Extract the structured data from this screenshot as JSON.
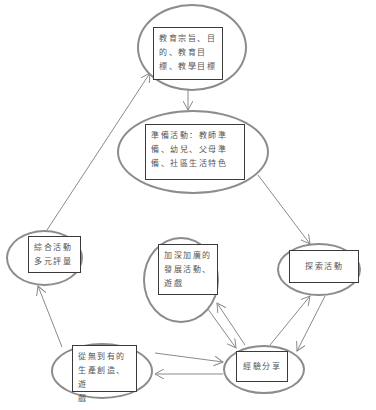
{
  "diagram": {
    "type": "cycle-flow",
    "colors": {
      "ellipse_stroke": "#8c8c8c",
      "box_stroke": "#3a3a3a",
      "text": "#555555",
      "edge": "#8a8a8a"
    },
    "nodes": [
      {
        "id": "goals",
        "lines": [
          "教育宗旨、目",
          "的、教育目",
          "標、教學目標"
        ]
      },
      {
        "id": "preparation",
        "lines": [
          "準備活動：教師準",
          "備、幼兒、父母準",
          "備、社區生活特色"
        ]
      },
      {
        "id": "exploration",
        "lines": [
          "探索活動"
        ]
      },
      {
        "id": "deepen",
        "lines": [
          "加深加廣的",
          "發展活動、",
          "遊戲"
        ]
      },
      {
        "id": "integrate",
        "lines": [
          "綜合活動",
          "多元評量"
        ]
      },
      {
        "id": "create",
        "lines": [
          "從無到有的",
          "生產創造、遊",
          "戲"
        ]
      },
      {
        "id": "share",
        "lines": [
          "經驗分享"
        ]
      }
    ],
    "edges": [
      {
        "from": "goals",
        "to": "preparation"
      },
      {
        "from": "preparation",
        "to": "exploration"
      },
      {
        "from": "exploration",
        "to": "share"
      },
      {
        "from": "share",
        "to": "exploration"
      },
      {
        "from": "deepen",
        "to": "share"
      },
      {
        "from": "share",
        "to": "deepen"
      },
      {
        "from": "create",
        "to": "share"
      },
      {
        "from": "share",
        "to": "create"
      },
      {
        "from": "create",
        "to": "integrate"
      },
      {
        "from": "integrate",
        "to": "goals"
      }
    ]
  }
}
